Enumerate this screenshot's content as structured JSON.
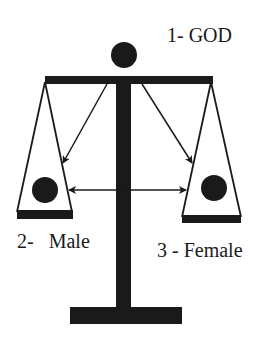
{
  "diagram": {
    "labels": {
      "god": "1- GOD",
      "male": "2-   Male",
      "female": "3 - Female"
    },
    "nodes": [
      {
        "id": "god",
        "label": "1- GOD",
        "shape": "filled-circle",
        "position": "top of scale"
      },
      {
        "id": "male",
        "label": "2-   Male",
        "shape": "filled-circle",
        "position": "left pan"
      },
      {
        "id": "female",
        "label": "3 - Female",
        "shape": "filled-circle",
        "position": "right pan"
      }
    ],
    "edges": [
      {
        "from": "god",
        "to": "male",
        "type": "arrow"
      },
      {
        "from": "god",
        "to": "female",
        "type": "arrow"
      },
      {
        "from": "male",
        "to": "female",
        "type": "double-arrow"
      }
    ],
    "colors": {
      "ink": "#1a1a1a",
      "background": "#ffffff"
    }
  }
}
